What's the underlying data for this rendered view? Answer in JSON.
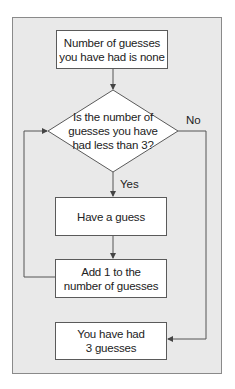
{
  "diagram": {
    "type": "flowchart",
    "nodes": {
      "start": {
        "text_line1": "Number of guesses",
        "text_line2": "you have had is none"
      },
      "decision": {
        "text_line1": "Is the number of",
        "text_line2": "guesses you have",
        "text_line3": "had less than 3?"
      },
      "guess": {
        "text": "Have a guess"
      },
      "increment": {
        "text_line1": "Add 1 to the",
        "text_line2": "number of guesses"
      },
      "end": {
        "text_line1": "You have had",
        "text_line2": "3 guesses"
      }
    },
    "edges": {
      "yes_label": "Yes",
      "no_label": "No"
    },
    "colors": {
      "panel": "#e9e9e9",
      "box": "#ffffff",
      "line": "#555555"
    }
  }
}
